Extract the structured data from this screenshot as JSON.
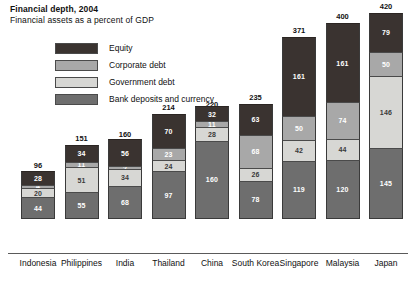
{
  "header": {
    "title": "Financial depth, 2004",
    "subtitle": "Financial assets as a percent of GDP"
  },
  "legend": {
    "position": "top-left-inside",
    "items": [
      {
        "label": "Equity",
        "color": "#3a3330",
        "key": "equity"
      },
      {
        "label": "Corporate debt",
        "color": "#a8a8a8",
        "key": "corporate_debt"
      },
      {
        "label": "Government debt",
        "color": "#d7d7d4",
        "key": "government_debt"
      },
      {
        "label": "Bank deposits and currency",
        "color": "#6e6e6e",
        "key": "bank_deposits"
      }
    ]
  },
  "chart_data": {
    "type": "bar",
    "stacked": true,
    "title": "Financial depth, 2004",
    "subtitle": "Financial assets as a percent of GDP",
    "xlabel": "",
    "ylabel": "",
    "ylim": [
      0,
      420
    ],
    "grid": false,
    "legend_position": "top-left-inside",
    "categories": [
      "Indonesia",
      "Philippines",
      "India",
      "Thailand",
      "China",
      "South Korea",
      "Singapore",
      "Malaysia",
      "Japan"
    ],
    "stack_order_bottom_to_top": [
      "Bank deposits and currency",
      "Government debt",
      "Corporate debt",
      "Equity"
    ],
    "series": [
      {
        "name": "Bank deposits and currency",
        "values": [
          44,
          55,
          68,
          97,
          160,
          78,
          119,
          120,
          145
        ]
      },
      {
        "name": "Government debt",
        "values": [
          20,
          51,
          34,
          24,
          28,
          26,
          42,
          44,
          146
        ]
      },
      {
        "name": "Corporate debt",
        "values": [
          4,
          11,
          2,
          23,
          11,
          68,
          50,
          74,
          50
        ]
      },
      {
        "name": "Equity",
        "values": [
          28,
          34,
          56,
          70,
          32,
          63,
          161,
          161,
          79
        ]
      }
    ],
    "totals": [
      96,
      151,
      160,
      214,
      220,
      235,
      371,
      400,
      420
    ]
  }
}
